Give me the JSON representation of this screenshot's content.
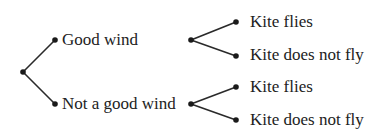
{
  "diagram": {
    "type": "tree",
    "line_color": "#2a2a2a",
    "text_color": "#222222",
    "root": {
      "children": [
        {
          "label": "Good wind",
          "children": [
            {
              "label": "Kite flies"
            },
            {
              "label": "Kite does not fly"
            }
          ]
        },
        {
          "label": "Not a good wind",
          "children": [
            {
              "label": "Kite flies"
            },
            {
              "label": "Kite does not fly"
            }
          ]
        }
      ]
    }
  }
}
